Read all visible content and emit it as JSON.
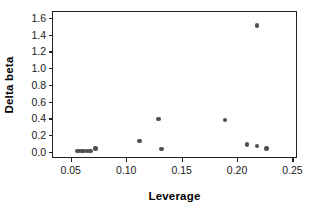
{
  "chart_data": {
    "type": "scatter",
    "title": "",
    "xlabel": "Leverage",
    "ylabel": "Delta beta",
    "xlim": [
      0.034,
      0.255
    ],
    "ylim": [
      -0.085,
      1.67
    ],
    "grid": false,
    "legend": "none",
    "xticks": [
      0.05,
      0.1,
      0.15,
      0.2,
      0.25
    ],
    "xticklabels": [
      "0.05",
      "0.10",
      "0.15",
      "0.20",
      "0.25"
    ],
    "yticks": [
      0.0,
      0.2,
      0.4,
      0.6,
      0.8,
      1.0,
      1.2,
      1.4,
      1.6
    ],
    "yticklabels": [
      "0.0",
      "0.2",
      "0.4",
      "0.6",
      "0.8",
      "1.0",
      "1.2",
      "1.4",
      "1.6"
    ],
    "marker_color": "#4d4d52",
    "marker_size": 4.4,
    "points": [
      {
        "x": 0.0555,
        "y": 0.012
      },
      {
        "x": 0.0575,
        "y": 0.014
      },
      {
        "x": 0.0595,
        "y": 0.013
      },
      {
        "x": 0.0615,
        "y": 0.011
      },
      {
        "x": 0.0645,
        "y": 0.008
      },
      {
        "x": 0.0665,
        "y": 0.007
      },
      {
        "x": 0.0685,
        "y": 0.009
      },
      {
        "x": 0.0725,
        "y": 0.04
      },
      {
        "x": 0.112,
        "y": 0.132
      },
      {
        "x": 0.129,
        "y": 0.39
      },
      {
        "x": 0.132,
        "y": 0.033
      },
      {
        "x": 0.189,
        "y": 0.378
      },
      {
        "x": 0.209,
        "y": 0.086
      },
      {
        "x": 0.218,
        "y": 0.071
      },
      {
        "x": 0.2265,
        "y": 0.042
      },
      {
        "x": 0.218,
        "y": 1.51
      }
    ]
  },
  "axes": {
    "x_title": "Leverage",
    "y_title": "Delta beta"
  }
}
